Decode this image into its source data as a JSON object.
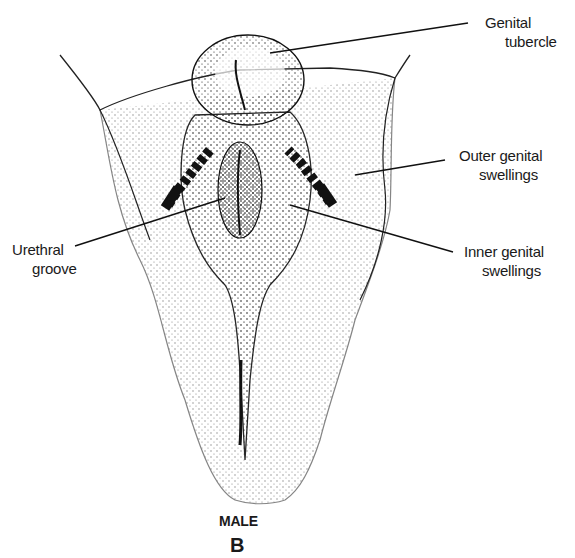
{
  "diagram": {
    "caption": "MALE",
    "panel_letter": "B",
    "labels": [
      {
        "id": "genital-tubercle",
        "line1": "Genital",
        "line2": "tubercle"
      },
      {
        "id": "outer-genital-swellings",
        "line1": "Outer genital",
        "line2": "swellings"
      },
      {
        "id": "inner-genital-swellings",
        "line1": "Inner genital",
        "line2": "swellings"
      },
      {
        "id": "urethral-groove",
        "line1": "Urethral",
        "line2": "groove"
      }
    ],
    "colors": {
      "ink": "#1a1a1a",
      "background": "#ffffff"
    }
  }
}
